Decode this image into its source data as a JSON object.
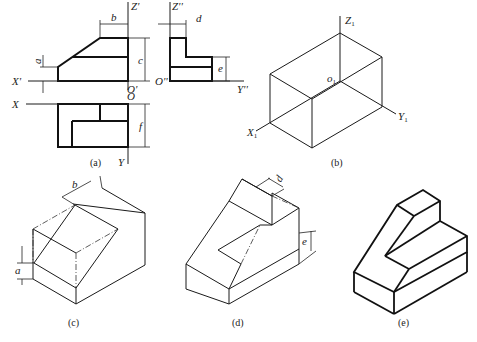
{
  "figure": {
    "panels": [
      {
        "id": "a",
        "caption": "(a)",
        "description": "Three-view orthographic projection"
      },
      {
        "id": "b",
        "caption": "(b)",
        "description": "Bounding box in isometric axes"
      },
      {
        "id": "c",
        "caption": "(c)",
        "description": "Cut front slope"
      },
      {
        "id": "d",
        "caption": "(d)",
        "description": "Cut side notch"
      },
      {
        "id": "e",
        "caption": "(e)",
        "description": "Final isometric drawing"
      }
    ],
    "axes_a": {
      "z_front": "Z'",
      "x_front": "X'",
      "origin_front": "O'",
      "z_side": "Z''",
      "origin_side": "O''",
      "y_side": "Y''",
      "x_top": "X",
      "origin_top": "O",
      "y_top": "Y"
    },
    "axes_b": {
      "z": "Z",
      "z_sub": "1",
      "x": "X",
      "x_sub": "1",
      "y": "Y",
      "y_sub": "1",
      "o": "o",
      "o_sub": "1"
    },
    "dimensions": {
      "a": "a",
      "b": "b",
      "c": "c",
      "d": "d",
      "e": "e",
      "f": "f"
    }
  }
}
